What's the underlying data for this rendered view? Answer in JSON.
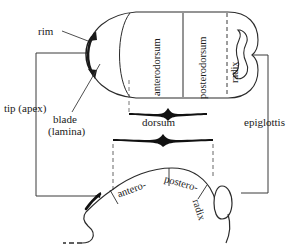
{
  "figure": {
    "background_color": "#ffffff",
    "ink_color": "#1a1a1a"
  },
  "labels": {
    "rim": "rim",
    "tip_apex": "tip (apex)",
    "blade_line1": "blade",
    "blade_line2": "(lamina)",
    "dorsum": "dorsum",
    "epiglottis": "epiglottis",
    "anterodorsum": "anterodorsum",
    "posterodorsum": "posterodorsum",
    "radix_top": "radix",
    "antero": "antero-",
    "postero": "postero-",
    "radix_bottom": "radix"
  },
  "views": {
    "superior": {
      "name": "superior (dorsal) view of tongue",
      "regions": [
        "anterodorsum",
        "posterodorsum",
        "radix"
      ]
    },
    "sagittal": {
      "name": "mid-sagittal profile view of tongue",
      "regions": [
        "antero-",
        "postero-",
        "radix"
      ]
    }
  },
  "braces": {
    "upper_brace": "dorsum",
    "lower_brace": "dorsum"
  },
  "leaders": {
    "rim_pointer": "arrow from rim label to tongue rim",
    "blade_pointer": "line from blade (lamina) label to blade region",
    "tip_bracket": "bracket linking tip (apex) to both views",
    "epiglottis_bracket": "bracket linking epiglottis to both views"
  }
}
